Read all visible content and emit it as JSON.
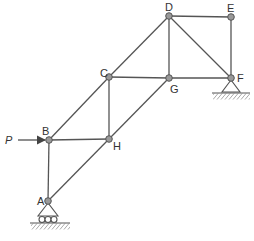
{
  "diagram": {
    "type": "truss",
    "colors": {
      "member": "#555555",
      "node_fill": "#999999",
      "node_stroke": "#555555",
      "text": "#333333"
    },
    "nodes": [
      {
        "id": "A",
        "label": "A",
        "x": 48,
        "y": 201
      },
      {
        "id": "B",
        "label": "B",
        "x": 49,
        "y": 140
      },
      {
        "id": "H",
        "label": "H",
        "x": 109,
        "y": 139
      },
      {
        "id": "C",
        "label": "C",
        "x": 109,
        "y": 77
      },
      {
        "id": "G",
        "label": "G",
        "x": 169,
        "y": 78
      },
      {
        "id": "D",
        "label": "D",
        "x": 169,
        "y": 16
      },
      {
        "id": "E",
        "label": "E",
        "x": 231,
        "y": 17
      },
      {
        "id": "F",
        "label": "F",
        "x": 231,
        "y": 78
      }
    ],
    "members": [
      [
        "A",
        "B"
      ],
      [
        "A",
        "H"
      ],
      [
        "B",
        "H"
      ],
      [
        "B",
        "C"
      ],
      [
        "H",
        "C"
      ],
      [
        "H",
        "G"
      ],
      [
        "C",
        "G"
      ],
      [
        "C",
        "D"
      ],
      [
        "G",
        "D"
      ],
      [
        "G",
        "F"
      ],
      [
        "D",
        "F"
      ],
      [
        "D",
        "E"
      ],
      [
        "E",
        "F"
      ]
    ],
    "load": {
      "label": "P",
      "at": "B",
      "direction": "right"
    },
    "supports": [
      {
        "at": "A",
        "type": "roller"
      },
      {
        "at": "F",
        "type": "pin"
      }
    ]
  }
}
